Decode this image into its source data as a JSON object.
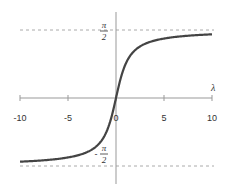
{
  "chart_data": {
    "type": "line",
    "title": "",
    "function": "arctan(x)",
    "xlabel": "λ",
    "ylabel": "",
    "xlim": [
      -10,
      10
    ],
    "ylim": [
      -1.5708,
      1.5708
    ],
    "x_ticks": [
      -10,
      -5,
      0,
      5,
      10
    ],
    "x_tick_labels": [
      "-10",
      "-5",
      "0",
      "5",
      "10"
    ],
    "asymptotes": [
      {
        "y": 1.5708,
        "label_num": "π",
        "label_den": "2",
        "sign": "",
        "style": "dashed"
      },
      {
        "y": -1.5708,
        "label_num": "π",
        "label_den": "2",
        "sign": "-",
        "style": "dashed"
      }
    ],
    "series": [
      {
        "name": "arctan",
        "x": [
          -10,
          -8,
          -6,
          -5,
          -4,
          -3,
          -2,
          -1.5,
          -1,
          -0.5,
          0,
          0.5,
          1,
          1.5,
          2,
          3,
          4,
          5,
          6,
          8,
          10
        ],
        "values": [
          -1.4711,
          -1.4464,
          -1.4056,
          -1.3734,
          -1.3258,
          -1.249,
          -1.1071,
          -0.9828,
          -0.7854,
          -0.4636,
          0,
          0.4636,
          0.7854,
          0.9828,
          1.1071,
          1.249,
          1.3258,
          1.3734,
          1.4056,
          1.4464,
          1.4711
        ]
      }
    ],
    "grid": false,
    "legend": null
  },
  "colors": {
    "curve": "#444444",
    "axis": "#999999",
    "asymptote": "#aaaaaa",
    "text": "#333333"
  }
}
